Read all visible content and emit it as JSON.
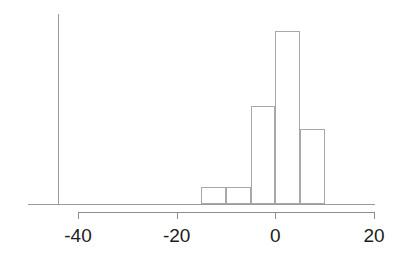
{
  "chart_data": {
    "type": "bar",
    "title": "",
    "subtitle": "",
    "xlabel": "",
    "ylabel": "",
    "grid": false,
    "legend": null,
    "legend_position": "none",
    "orientation": "vertical",
    "histogram": true,
    "bin_width": 5,
    "xlim": [
      -45,
      22
    ],
    "ylim": [
      0,
      40
    ],
    "xticks": [
      -40,
      -20,
      0,
      20
    ],
    "xticklabels": [
      "-40",
      "-20",
      "0",
      "20"
    ],
    "yticks": [],
    "yticklabels": [],
    "bin_edges": [
      -15,
      -10,
      -5,
      0,
      5,
      10
    ],
    "categories": [
      "-15 to -10",
      "-10 to -5",
      "-5 to 0",
      "0 to 5",
      "5 to 10"
    ],
    "bin_centers": [
      -12.5,
      -7.5,
      -2.5,
      2.5,
      7.5
    ],
    "values": [
      3.7,
      3.7,
      21.5,
      38.0,
      16.5
    ],
    "series": [
      {
        "name": "frequency",
        "values": [
          3.7,
          3.7,
          21.5,
          38.0,
          16.5
        ]
      }
    ],
    "colors": {
      "bar_fill": "#ffffff",
      "bar_edge": "#a8a8a8",
      "axis": "#9a9a9a",
      "tick_axis": "#8d8d8d",
      "tick_label": "#1c1c1c",
      "background": "#ffffff"
    }
  },
  "axes": {
    "x_tick_labels": [
      "-40",
      "-20",
      "0",
      "20"
    ]
  }
}
